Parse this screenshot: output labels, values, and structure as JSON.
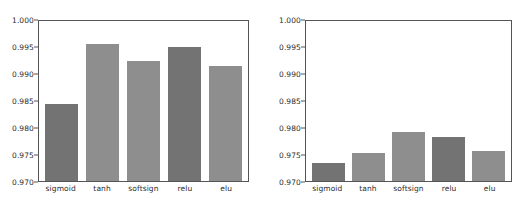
{
  "figure": {
    "clipped_caption": "accuracy",
    "axis_color": "#555555",
    "text_color": "#2b2b2b",
    "background": "#ffffff"
  },
  "colors": {
    "bar_light": "#8e8e8e",
    "bar_dark": "#737373"
  },
  "chart_data": [
    {
      "type": "bar",
      "panel": "left",
      "title": "",
      "xlabel": "",
      "ylabel": "",
      "categories": [
        "sigmoid",
        "tanh",
        "softsign",
        "relu",
        "elu"
      ],
      "values": [
        0.9845,
        0.9957,
        0.9925,
        0.9952,
        0.9915
      ],
      "ylim": [
        0.97,
        1.0
      ],
      "yticks": [
        "1.000",
        "0.995",
        "0.990",
        "0.985",
        "0.980",
        "0.975",
        "0.970"
      ],
      "ytick_values": [
        1.0,
        0.995,
        0.99,
        0.985,
        0.98,
        0.975,
        0.97
      ],
      "grid": false,
      "legend": "none",
      "bar_shades": [
        "dark",
        "light",
        "light",
        "dark",
        "light"
      ]
    },
    {
      "type": "bar",
      "panel": "right",
      "title": "",
      "xlabel": "",
      "ylabel": "",
      "categories": [
        "sigmoid",
        "tanh",
        "softsign",
        "relu",
        "elu"
      ],
      "values": [
        0.9733,
        0.9753,
        0.9791,
        0.9782,
        0.9756
      ],
      "ylim": [
        0.97,
        1.0
      ],
      "yticks": [
        "1.000",
        "0.995",
        "0.990",
        "0.985",
        "0.980",
        "0.975",
        "0.970"
      ],
      "ytick_values": [
        1.0,
        0.995,
        0.99,
        0.985,
        0.98,
        0.975,
        0.97
      ],
      "grid": false,
      "legend": "none",
      "bar_shades": [
        "dark",
        "light",
        "light",
        "dark",
        "light"
      ]
    }
  ]
}
